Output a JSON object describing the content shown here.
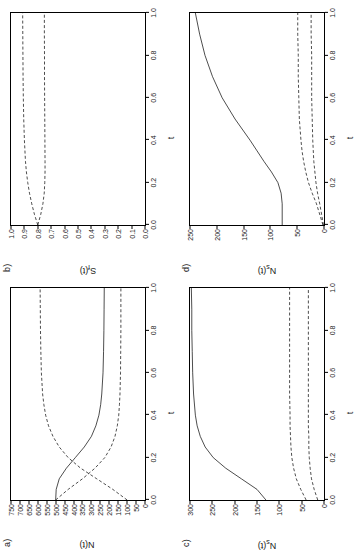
{
  "figure": {
    "background": "#ffffff",
    "line_color": "#000000",
    "orientation_note": "rotated-90-ccw"
  },
  "panels": [
    {
      "tag": "a)",
      "xlabel": "t",
      "ylabel_main": "N(t)",
      "ylabel_sub": "",
      "xticks": [
        "0.0",
        "0.2",
        "0.4",
        "0.6",
        "0.8",
        "1.0"
      ],
      "yticks": [
        "0",
        "50",
        "100",
        "150",
        "200",
        "250",
        "300",
        "350",
        "400",
        "450",
        "500",
        "550",
        "600",
        "650",
        "700",
        "750"
      ]
    },
    {
      "tag": "b)",
      "xlabel": "t",
      "ylabel_main": "S(t)",
      "ylabel_sub": "f",
      "xticks": [
        "0.0",
        "0.2",
        "0.4",
        "0.6",
        "0.8",
        "1.0"
      ],
      "yticks": [
        "0.0",
        "0.1",
        "0.2",
        "0.3",
        "0.4",
        "0.5",
        "0.6",
        "0.7",
        "0.8",
        "0.9",
        "1.0"
      ]
    },
    {
      "tag": "c)",
      "xlabel": "t",
      "ylabel_main": "N(t)",
      "ylabel_sub": "s",
      "xticks": [
        "0.0",
        "0.2",
        "0.4",
        "0.6",
        "0.8",
        "1.0"
      ],
      "yticks": [
        "0",
        "50",
        "100",
        "150",
        "200",
        "250",
        "300"
      ]
    },
    {
      "tag": "d)",
      "xlabel": "t",
      "ylabel_main": "N(t)",
      "ylabel_sub": "s",
      "xticks": [
        "0.0",
        "0.2",
        "0.4",
        "0.6",
        "0.8",
        "1.0"
      ],
      "yticks": [
        "0",
        "50",
        "100",
        "150",
        "200",
        "250"
      ]
    }
  ],
  "chart_data": [
    {
      "type": "line",
      "panel": "a)",
      "title": "",
      "xlabel": "t",
      "ylabel": "N(t)",
      "xlim": [
        0.0,
        1.0
      ],
      "ylim": [
        0,
        750
      ],
      "grid": false,
      "legend": null,
      "x": [
        0.0,
        0.05,
        0.1,
        0.15,
        0.2,
        0.25,
        0.3,
        0.35,
        0.4,
        0.45,
        0.5,
        0.6,
        0.7,
        0.8,
        0.9,
        1.0
      ],
      "series": [
        {
          "name": "solid",
          "style": "solid",
          "values": [
            500,
            497,
            480,
            440,
            390,
            340,
            300,
            275,
            258,
            248,
            242,
            235,
            232,
            230,
            229,
            228
          ]
        },
        {
          "name": "dashed-upper",
          "style": "dashed",
          "values": [
            100,
            180,
            270,
            360,
            430,
            480,
            515,
            540,
            556,
            566,
            573,
            580,
            583,
            585,
            586,
            587
          ]
        },
        {
          "name": "dashed-lower",
          "style": "dashed",
          "values": [
            500,
            430,
            350,
            280,
            225,
            190,
            168,
            155,
            147,
            143,
            140,
            137,
            136,
            135,
            135,
            135
          ]
        }
      ]
    },
    {
      "type": "line",
      "panel": "b)",
      "title": "",
      "xlabel": "t",
      "ylabel": "S_f(t)",
      "xlim": [
        0.0,
        1.0
      ],
      "ylim": [
        0.0,
        1.0
      ],
      "grid": false,
      "legend": null,
      "x": [
        0.0,
        0.05,
        0.1,
        0.15,
        0.2,
        0.25,
        0.3,
        0.4,
        0.5,
        0.6,
        0.7,
        0.8,
        0.9,
        1.0
      ],
      "series": [
        {
          "name": "dashed-upper",
          "style": "dashed",
          "values": [
            0.8,
            0.825,
            0.845,
            0.862,
            0.875,
            0.885,
            0.892,
            0.9,
            0.905,
            0.908,
            0.91,
            0.911,
            0.912,
            0.913
          ]
        },
        {
          "name": "dashed-lower",
          "style": "dashed",
          "values": [
            0.8,
            0.778,
            0.762,
            0.752,
            0.748,
            0.746,
            0.746,
            0.747,
            0.748,
            0.749,
            0.75,
            0.75,
            0.751,
            0.751
          ]
        }
      ]
    },
    {
      "type": "line",
      "panel": "c)",
      "title": "",
      "xlabel": "t",
      "ylabel": "N_s(t)",
      "xlim": [
        0.0,
        1.0
      ],
      "ylim": [
        0,
        300
      ],
      "grid": false,
      "legend": null,
      "x": [
        0.0,
        0.05,
        0.1,
        0.15,
        0.2,
        0.25,
        0.3,
        0.35,
        0.4,
        0.5,
        0.6,
        0.7,
        0.8,
        0.9,
        1.0
      ],
      "series": [
        {
          "name": "solid",
          "style": "solid",
          "values": [
            130,
            150,
            185,
            220,
            248,
            266,
            277,
            284,
            288,
            292,
            294,
            295,
            296,
            296,
            297
          ]
        },
        {
          "name": "dashed-upper",
          "style": "dashed",
          "values": [
            40,
            52,
            62,
            68,
            72,
            74,
            75,
            76,
            76,
            77,
            77,
            77,
            77,
            77,
            77
          ]
        },
        {
          "name": "dashed-lower",
          "style": "dashed",
          "values": [
            14,
            22,
            28,
            31,
            33,
            34,
            34,
            35,
            35,
            35,
            35,
            35,
            35,
            35,
            35
          ]
        }
      ]
    },
    {
      "type": "line",
      "panel": "d)",
      "title": "",
      "xlabel": "t",
      "ylabel": "N_s(t)",
      "xlim": [
        0.0,
        1.0
      ],
      "ylim": [
        0,
        250
      ],
      "grid": false,
      "legend": null,
      "x": [
        0.0,
        0.1,
        0.15,
        0.2,
        0.25,
        0.3,
        0.35,
        0.4,
        0.5,
        0.6,
        0.7,
        0.8,
        0.9,
        1.0
      ],
      "series": [
        {
          "name": "solid",
          "style": "solid",
          "values": [
            78,
            78,
            80,
            86,
            98,
            112,
            125,
            138,
            166,
            190,
            208,
            222,
            232,
            240
          ]
        },
        {
          "name": "dashed-upper",
          "style": "dashed",
          "values": [
            2,
            14,
            22,
            29,
            34,
            38,
            41,
            43,
            46,
            47,
            48,
            48,
            49,
            49
          ]
        },
        {
          "name": "dashed-lower",
          "style": "dashed",
          "values": [
            1,
            8,
            12,
            15,
            17,
            19,
            20,
            21,
            22,
            23,
            23,
            23,
            24,
            24
          ]
        }
      ]
    }
  ]
}
